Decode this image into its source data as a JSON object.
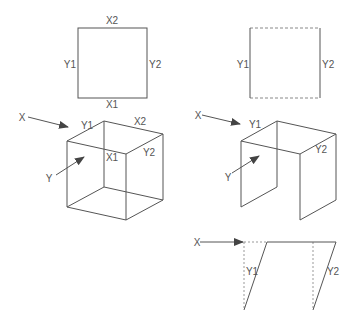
{
  "diagram": {
    "panels": [
      {
        "id": "square-solid",
        "labels": {
          "top": "X2",
          "bottom": "X1",
          "left": "Y1",
          "right": "Y2"
        }
      },
      {
        "id": "square-dashed",
        "labels": {
          "left": "Y1",
          "right": "Y2"
        }
      },
      {
        "id": "cube-full",
        "labels": {
          "arrow_x": "X",
          "arrow_y": "Y",
          "top_left": "Y1",
          "top_right": "X2",
          "inner": "X1",
          "right": "Y2"
        }
      },
      {
        "id": "cube-open",
        "labels": {
          "arrow_x": "X",
          "arrow_y": "Y",
          "top_left": "Y1",
          "right": "Y2"
        }
      },
      {
        "id": "side-shear",
        "labels": {
          "arrow_x": "X",
          "left": "Y1",
          "right": "Y2"
        }
      }
    ],
    "colors": {
      "line": "#555555",
      "dashed": "#888888",
      "text": "#555555"
    }
  }
}
